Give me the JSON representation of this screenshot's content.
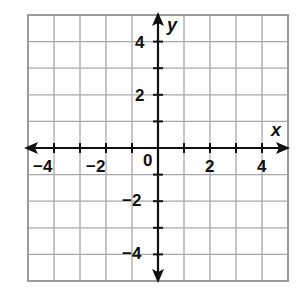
{
  "chart_data": {
    "type": "coordinate-plane",
    "title": "",
    "xlabel": "x",
    "ylabel": "y",
    "xlim": [
      -5,
      5
    ],
    "ylim": [
      -5,
      5
    ],
    "grid": true,
    "grid_step": 1,
    "x_tick_labels": [
      {
        "value": -4,
        "label": "−4"
      },
      {
        "value": -2,
        "label": "−2"
      },
      {
        "value": 0,
        "label": "0"
      },
      {
        "value": 2,
        "label": "2"
      },
      {
        "value": 4,
        "label": "4"
      }
    ],
    "y_tick_labels": [
      {
        "value": 4,
        "label": "4"
      },
      {
        "value": 2,
        "label": "2"
      },
      {
        "value": -2,
        "label": "−2"
      },
      {
        "value": -4,
        "label": "−4"
      }
    ],
    "arrows": "both ends on both axes",
    "data_points": []
  },
  "colors": {
    "grid": "#a8a8a8",
    "border": "#9a9a9a",
    "axis": "#111111",
    "background": "#ffffff"
  }
}
